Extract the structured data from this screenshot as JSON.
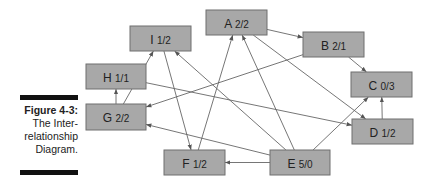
{
  "caption": {
    "figure": "Figure 4-3:",
    "lines": [
      "The Inter-",
      "relationship",
      "Diagram."
    ]
  },
  "nodes": [
    {
      "id": "A",
      "label": "A",
      "score": "2/2",
      "x": 206,
      "y": 10,
      "w": 61,
      "h": 25
    },
    {
      "id": "B",
      "label": "B",
      "score": "2/1",
      "x": 303,
      "y": 32,
      "w": 61,
      "h": 25
    },
    {
      "id": "C",
      "label": "C",
      "score": "0/3",
      "x": 351,
      "y": 72,
      "w": 61,
      "h": 25
    },
    {
      "id": "D",
      "label": "D",
      "score": "1/2",
      "x": 352,
      "y": 119,
      "w": 61,
      "h": 25
    },
    {
      "id": "E",
      "label": "E",
      "score": "5/0",
      "x": 270,
      "y": 150,
      "w": 60,
      "h": 25
    },
    {
      "id": "F",
      "label": "F",
      "score": "1/2",
      "x": 164,
      "y": 150,
      "w": 61,
      "h": 25
    },
    {
      "id": "G",
      "label": "G",
      "score": "2/2",
      "x": 86,
      "y": 104,
      "w": 60,
      "h": 26
    },
    {
      "id": "H",
      "label": "H",
      "score": "1/1",
      "x": 86,
      "y": 64,
      "w": 60,
      "h": 25
    },
    {
      "id": "I",
      "label": "I",
      "score": "1/2",
      "x": 130,
      "y": 26,
      "w": 61,
      "h": 25
    }
  ],
  "edges": [
    {
      "from": "A",
      "to": "B"
    },
    {
      "from": "B",
      "to": "C"
    },
    {
      "from": "D",
      "to": "C"
    },
    {
      "from": "E",
      "to": "C"
    },
    {
      "from": "E",
      "to": "F"
    },
    {
      "from": "E",
      "to": "A"
    },
    {
      "from": "E",
      "to": "I"
    },
    {
      "from": "E",
      "to": "G"
    },
    {
      "from": "F",
      "to": "A"
    },
    {
      "from": "G",
      "to": "H"
    },
    {
      "from": "G",
      "to": "I"
    },
    {
      "from": "I",
      "to": "F"
    },
    {
      "from": "B",
      "to": "G"
    },
    {
      "from": "H",
      "to": "D"
    },
    {
      "from": "A",
      "to": "D"
    }
  ]
}
